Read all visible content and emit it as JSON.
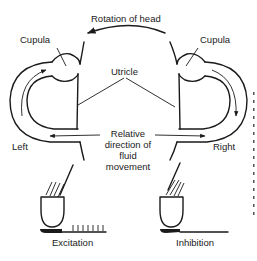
{
  "diagram": {
    "top_label": "Rotation of head",
    "left": {
      "cupula_label": "Cupula",
      "side_label": "Left",
      "response_label": "Excitation",
      "spike_count": 7
    },
    "right": {
      "cupula_label": "Cupula",
      "side_label": "Right",
      "response_label": "Inhibition",
      "spike_count": 0
    },
    "center_label": "Utricle",
    "fluid_label": {
      "line1": "Relative",
      "line2": "direction of",
      "line3": "fluid",
      "line4": "movement"
    },
    "colors": {
      "ink": "#1a1a1a",
      "background": "#ffffff"
    }
  }
}
